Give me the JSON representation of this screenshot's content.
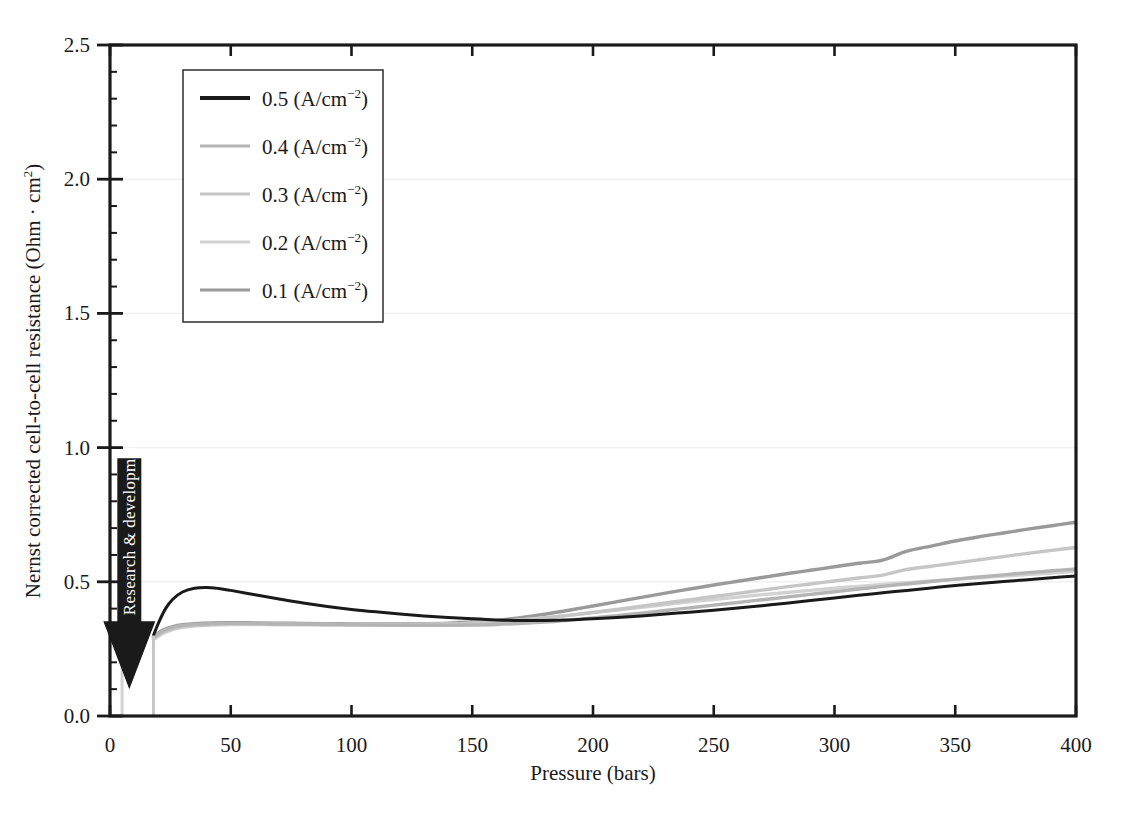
{
  "chart_data": {
    "type": "line",
    "title": "",
    "xlabel": "Pressure (bars)",
    "ylabel": "Nernst corrected cell-to-cell resistance (Ohm · cm²)",
    "xlim": [
      0,
      400
    ],
    "ylim": [
      0.0,
      2.5
    ],
    "xticks": [
      0,
      50,
      100,
      150,
      200,
      250,
      300,
      350,
      400
    ],
    "xticklabels": [
      "0",
      "50",
      "100",
      "150",
      "200",
      "250",
      "300",
      "350",
      "400"
    ],
    "yticks": [
      0.0,
      0.5,
      1.0,
      1.5,
      2.0,
      2.5
    ],
    "yticklabels": [
      "0.0",
      "0.5",
      "1.0",
      "1.5",
      "2.0",
      "2.5"
    ],
    "minor_tick_step_y": 0.1,
    "grid": "horizontal-major-faint",
    "legend_position": "upper-left-inside",
    "series": [
      {
        "name": "0.5 (A/cm⁻²)",
        "label_value": "0.5",
        "label_units": "(A/cm",
        "label_sup": "−2",
        "color": "#1a1a1a",
        "x": [
          18,
          20,
          23,
          26,
          30,
          35,
          40,
          45,
          50,
          60,
          70,
          80,
          90,
          100,
          110,
          120,
          130,
          140,
          150,
          160,
          170,
          180,
          190,
          200,
          210,
          220,
          230,
          240,
          250,
          260,
          270,
          280,
          290,
          300,
          310,
          320,
          330,
          340,
          350,
          360,
          370,
          380,
          390,
          400
        ],
        "y": [
          0.3,
          0.345,
          0.4,
          0.435,
          0.462,
          0.476,
          0.479,
          0.475,
          0.468,
          0.452,
          0.436,
          0.421,
          0.408,
          0.397,
          0.388,
          0.38,
          0.373,
          0.367,
          0.362,
          0.358,
          0.356,
          0.356,
          0.358,
          0.362,
          0.367,
          0.373,
          0.38,
          0.387,
          0.394,
          0.402,
          0.411,
          0.42,
          0.43,
          0.44,
          0.45,
          0.459,
          0.468,
          0.477,
          0.486,
          0.494,
          0.501,
          0.508,
          0.515,
          0.522
        ]
      },
      {
        "name": "0.4 (A/cm⁻²)",
        "label_value": "0.4",
        "label_units": "(A/cm",
        "label_sup": "−2",
        "color": "#b4b4b4",
        "x": [
          18,
          22,
          26,
          30,
          36,
          42,
          50,
          60,
          70,
          80,
          90,
          100,
          110,
          120,
          130,
          140,
          150,
          160,
          170,
          180,
          190,
          200,
          210,
          220,
          230,
          240,
          250,
          260,
          270,
          280,
          290,
          300,
          310,
          320,
          330,
          340,
          350,
          360,
          370,
          380,
          390,
          400
        ],
        "y": [
          0.292,
          0.318,
          0.33,
          0.337,
          0.342,
          0.344,
          0.345,
          0.344,
          0.343,
          0.342,
          0.341,
          0.34,
          0.339,
          0.338,
          0.338,
          0.338,
          0.339,
          0.341,
          0.345,
          0.35,
          0.357,
          0.365,
          0.374,
          0.383,
          0.393,
          0.403,
          0.413,
          0.423,
          0.433,
          0.443,
          0.453,
          0.463,
          0.473,
          0.483,
          0.492,
          0.501,
          0.51,
          0.518,
          0.526,
          0.534,
          0.541,
          0.548
        ]
      },
      {
        "name": "0.3 (A/cm⁻²)",
        "label_value": "0.3",
        "label_units": "(A/cm",
        "label_sup": "−2",
        "color": "#c6c6c6",
        "x": [
          18,
          22,
          26,
          30,
          36,
          42,
          50,
          60,
          70,
          80,
          90,
          100,
          110,
          120,
          130,
          140,
          150,
          160,
          170,
          180,
          190,
          200,
          210,
          220,
          230,
          240,
          250,
          260,
          270,
          280,
          290,
          300,
          310,
          320,
          330,
          340,
          350,
          360,
          370,
          380,
          390,
          400
        ],
        "y": [
          0.288,
          0.312,
          0.326,
          0.333,
          0.339,
          0.342,
          0.344,
          0.344,
          0.343,
          0.342,
          0.342,
          0.341,
          0.341,
          0.341,
          0.342,
          0.343,
          0.346,
          0.35,
          0.357,
          0.365,
          0.375,
          0.386,
          0.397,
          0.409,
          0.421,
          0.433,
          0.445,
          0.457,
          0.469,
          0.481,
          0.492,
          0.503,
          0.514,
          0.525,
          0.546,
          0.558,
          0.57,
          0.582,
          0.594,
          0.606,
          0.617,
          0.628
        ]
      },
      {
        "name": "0.2 (A/cm⁻²)",
        "label_value": "0.2",
        "label_units": "(A/cm",
        "label_sup": "−2",
        "color": "#d2d2d2",
        "x": [
          18,
          22,
          26,
          30,
          36,
          42,
          50,
          60,
          70,
          80,
          90,
          100,
          110,
          120,
          130,
          140,
          150,
          160,
          170,
          180,
          190,
          200,
          210,
          220,
          230,
          240,
          250,
          260,
          270,
          280,
          290,
          300,
          310,
          320,
          330,
          340,
          350,
          360,
          370,
          380,
          390,
          400
        ],
        "y": [
          0.285,
          0.308,
          0.322,
          0.33,
          0.336,
          0.339,
          0.341,
          0.341,
          0.34,
          0.34,
          0.339,
          0.339,
          0.339,
          0.34,
          0.341,
          0.343,
          0.346,
          0.351,
          0.358,
          0.366,
          0.375,
          0.385,
          0.395,
          0.405,
          0.415,
          0.425,
          0.434,
          0.443,
          0.452,
          0.46,
          0.468,
          0.476,
          0.483,
          0.49,
          0.497,
          0.503,
          0.509,
          0.515,
          0.521,
          0.527,
          0.533,
          0.539
        ]
      },
      {
        "name": "0.1 (A/cm⁻²)",
        "label_value": "0.1",
        "label_units": "(A/cm",
        "label_sup": "−2",
        "color": "#9a9a9a",
        "x": [
          18,
          22,
          26,
          30,
          36,
          42,
          50,
          60,
          70,
          80,
          90,
          100,
          110,
          120,
          130,
          140,
          150,
          160,
          170,
          180,
          190,
          200,
          210,
          220,
          230,
          240,
          250,
          260,
          270,
          280,
          290,
          300,
          310,
          320,
          330,
          340,
          350,
          360,
          370,
          380,
          390,
          400
        ],
        "y": [
          0.295,
          0.32,
          0.333,
          0.34,
          0.345,
          0.347,
          0.348,
          0.347,
          0.346,
          0.345,
          0.344,
          0.343,
          0.343,
          0.343,
          0.344,
          0.346,
          0.35,
          0.356,
          0.366,
          0.379,
          0.394,
          0.41,
          0.426,
          0.442,
          0.458,
          0.473,
          0.488,
          0.502,
          0.516,
          0.53,
          0.543,
          0.556,
          0.569,
          0.581,
          0.614,
          0.633,
          0.652,
          0.668,
          0.682,
          0.696,
          0.709,
          0.722
        ]
      }
    ],
    "drop_lines": [
      {
        "x": 5,
        "y_top": 0.33,
        "y_bottom": 0.0,
        "color": "#d2d2d2"
      },
      {
        "x": 18,
        "y_top": 0.3,
        "y_bottom": 0.0,
        "color": "#c6c6c6"
      }
    ],
    "annotations": [
      {
        "text": "Research & development",
        "kind": "down-arrow",
        "x_bars": 8,
        "y_top": 0.96,
        "y_tip": 0.1,
        "color": "#1a1a1a",
        "text_color": "#ffffff"
      }
    ]
  },
  "axes": {
    "x_title": "Pressure (bars)",
    "y_title_main": "Nernst corrected cell-to-cell resistance (Ohm · cm",
    "y_title_sup": "2",
    "y_title_close": ")"
  }
}
